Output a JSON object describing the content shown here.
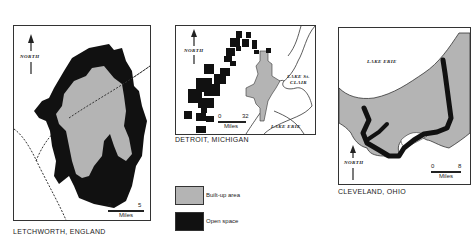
{
  "maps": [
    {
      "id": "letchworth",
      "caption": "LETCHWORTH, ENGLAND",
      "north_label": "NORTH",
      "scale": {
        "start": "0",
        "end": "5",
        "unit": "Miles"
      }
    },
    {
      "id": "detroit",
      "caption": "DETROIT, MICHIGAN",
      "north_label": "NORTH",
      "scale": {
        "start": "0",
        "end": "32",
        "unit": "Miles"
      },
      "water_labels": [
        "LAKE ST. CLAIR",
        "LAKE ERIE"
      ],
      "water_label_lines": [
        "LAKE St.",
        "CLAIR"
      ]
    },
    {
      "id": "cleveland",
      "caption": "CLEVELAND, OHIO",
      "north_label": "NORTH",
      "scale": {
        "start": "0",
        "end": "8",
        "unit": "Miles"
      },
      "water_labels": [
        "LAKE ERIE"
      ]
    }
  ],
  "legend": {
    "items": [
      {
        "label": "Built-up area",
        "color": "#b4b4b4"
      },
      {
        "label": "Open space",
        "color": "#111111"
      }
    ]
  },
  "colors": {
    "built_up": "#b4b4b4",
    "open_space": "#111111",
    "line": "#333333"
  }
}
